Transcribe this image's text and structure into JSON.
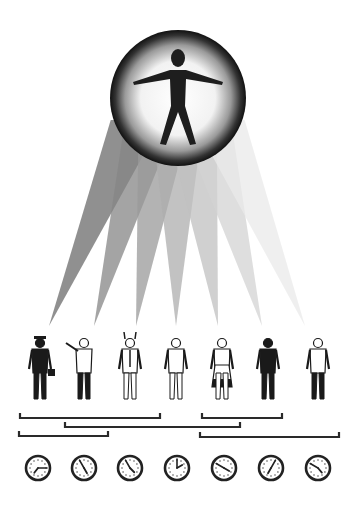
{
  "illustration": {
    "central_icon": {
      "name": "universal-person",
      "center": [
        178,
        98
      ],
      "radius": 68
    },
    "beams": {
      "origin_y": 120,
      "tip_y": 326,
      "tips_x": [
        49,
        94,
        136,
        176,
        218,
        262,
        305
      ],
      "base_half_width": 26,
      "fills": [
        "#6b6b6b",
        "#858585",
        "#9a9a9a",
        "#adadad",
        "#c0c0c0",
        "#d3d3d3",
        "#eaeaea"
      ]
    },
    "figures": [
      {
        "name": "businessman-with-briefcase",
        "x": 40,
        "tone": "dark"
      },
      {
        "name": "pointing-person",
        "x": 84,
        "tone": "outline"
      },
      {
        "name": "horned-devil-in-tie",
        "x": 130,
        "tone": "outline"
      },
      {
        "name": "worker-in-overalls",
        "x": 176,
        "tone": "outline"
      },
      {
        "name": "woman-in-apron",
        "x": 222,
        "tone": "mixed"
      },
      {
        "name": "uniformed-officer",
        "x": 268,
        "tone": "dark"
      },
      {
        "name": "dancing-man-in-jacket",
        "x": 318,
        "tone": "mixed"
      }
    ],
    "brackets": [
      {
        "x1": 20,
        "x2": 160,
        "y": 418
      },
      {
        "x1": 202,
        "x2": 282,
        "y": 418
      },
      {
        "x1": 65,
        "x2": 240,
        "y": 427
      },
      {
        "x1": 19,
        "x2": 108,
        "y": 436
      },
      {
        "x1": 200,
        "x2": 339,
        "y": 437
      }
    ],
    "clocks": [
      {
        "x": 38,
        "time": "7:15",
        "hour_deg": 218,
        "minute_deg": 90
      },
      {
        "x": 84,
        "time": "4:55",
        "hour_deg": 150,
        "minute_deg": 330
      },
      {
        "x": 130,
        "time": "4:55",
        "hour_deg": 135,
        "minute_deg": 330
      },
      {
        "x": 177,
        "time": "2:00",
        "hour_deg": 60,
        "minute_deg": 0
      },
      {
        "x": 224,
        "time": "3:50",
        "hour_deg": 120,
        "minute_deg": 300
      },
      {
        "x": 271,
        "time": "7:05",
        "hour_deg": 210,
        "minute_deg": 30
      },
      {
        "x": 318,
        "time": "4:50",
        "hour_deg": 140,
        "minute_deg": 300
      }
    ],
    "clock_y": 468,
    "clock_radius": 12
  }
}
